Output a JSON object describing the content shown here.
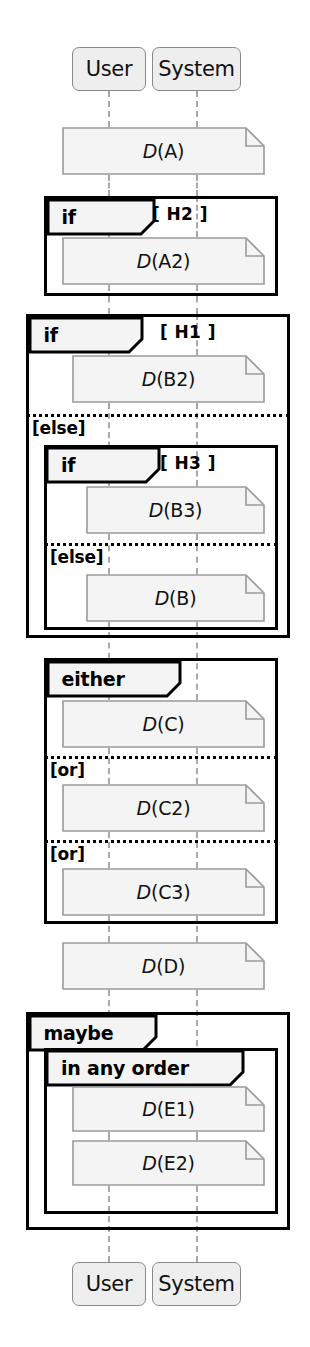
{
  "diagram": {
    "kind": "uml-sequence-diagram",
    "width": 310,
    "height": 1347,
    "colors": {
      "frame_border": "#000000",
      "note_fill": "#f4f4f4",
      "note_border": "#9a9a9a",
      "actor_fill": "#eeeeee",
      "actor_border": "#8a8a8a",
      "lifeline": "#a9a9a9",
      "text": "#111111"
    }
  },
  "actors": {
    "header": [
      {
        "name": "User",
        "x": 72,
        "y": 47,
        "w": 74,
        "h": 44
      },
      {
        "name": "System",
        "x": 152,
        "y": 47,
        "w": 89,
        "h": 44
      }
    ],
    "footer": [
      {
        "name": "User",
        "x": 72,
        "y": 1262,
        "w": 74,
        "h": 44
      },
      {
        "name": "System",
        "x": 152,
        "y": 1262,
        "w": 89,
        "h": 44
      }
    ]
  },
  "lifelines": [
    {
      "actor": "User",
      "x": 108
    },
    {
      "actor": "System",
      "x": 196
    }
  ],
  "notes": [
    {
      "id": "A",
      "prefix": "D",
      "arg": "(A)",
      "x": 62,
      "y": 127,
      "w": 203,
      "h": 48
    },
    {
      "id": "A2",
      "prefix": "D",
      "arg": "(A2)",
      "x": 62,
      "y": 237,
      "w": 203,
      "h": 48
    },
    {
      "id": "B2",
      "prefix": "D",
      "arg": "(B2)",
      "x": 72,
      "y": 355,
      "w": 193,
      "h": 48
    },
    {
      "id": "B3",
      "prefix": "D",
      "arg": "(B3)",
      "x": 86,
      "y": 486,
      "w": 179,
      "h": 48
    },
    {
      "id": "B",
      "prefix": "D",
      "arg": "(B)",
      "x": 86,
      "y": 574,
      "w": 179,
      "h": 48
    },
    {
      "id": "C",
      "prefix": "D",
      "arg": "(C)",
      "x": 62,
      "y": 700,
      "w": 203,
      "h": 48
    },
    {
      "id": "C2",
      "prefix": "D",
      "arg": "(C2)",
      "x": 62,
      "y": 784,
      "w": 203,
      "h": 48
    },
    {
      "id": "C3",
      "prefix": "D",
      "arg": "(C3)",
      "x": 62,
      "y": 868,
      "w": 203,
      "h": 48
    },
    {
      "id": "D",
      "prefix": "D",
      "arg": "(D)",
      "x": 62,
      "y": 942,
      "w": 203,
      "h": 48
    },
    {
      "id": "E1",
      "prefix": "D",
      "arg": "(E1)",
      "x": 72,
      "y": 1086,
      "w": 193,
      "h": 46
    },
    {
      "id": "E2",
      "prefix": "D",
      "arg": "(E2)",
      "x": 72,
      "y": 1140,
      "w": 193,
      "h": 46
    }
  ],
  "fragments": [
    {
      "id": "h2",
      "operator": "if",
      "guard": "[ H2 ]",
      "guard_x": 152,
      "guard_y": 204,
      "tab_width": 106,
      "x": 44,
      "y": 196,
      "w": 234,
      "h": 100,
      "inner": false,
      "separators": [],
      "operand_labels": []
    },
    {
      "id": "h1",
      "operator": "if",
      "guard": "[ H1 ]",
      "guard_x": 160,
      "guard_y": 322,
      "tab_width": 112,
      "x": 26,
      "y": 314,
      "w": 264,
      "h": 324,
      "inner": false,
      "separators": [
        {
          "y": 414,
          "x": 26,
          "w": 264
        }
      ],
      "operand_labels": [
        {
          "text": "[else]",
          "x": 32,
          "y": 418
        }
      ]
    },
    {
      "id": "h3",
      "operator": "if",
      "guard": "[ H3 ]",
      "guard_x": 160,
      "guard_y": 453,
      "tab_width": 112,
      "x": 44,
      "y": 445,
      "w": 234,
      "h": 185,
      "inner": true,
      "separators": [
        {
          "y": 543,
          "x": 44,
          "w": 234
        }
      ],
      "operand_labels": [
        {
          "text": "[else]",
          "x": 50,
          "y": 547
        }
      ]
    },
    {
      "id": "alt-c",
      "operator": "either",
      "guard": "",
      "guard_x": 0,
      "guard_y": 0,
      "tab_width": 132,
      "x": 44,
      "y": 658,
      "w": 234,
      "h": 266,
      "inner": false,
      "separators": [
        {
          "y": 756,
          "x": 44,
          "w": 234
        },
        {
          "y": 840,
          "x": 44,
          "w": 234
        }
      ],
      "operand_labels": [
        {
          "text": "[or]",
          "x": 50,
          "y": 760
        },
        {
          "text": "[or]",
          "x": 50,
          "y": 844
        }
      ]
    },
    {
      "id": "opt-e",
      "operator": "maybe",
      "guard": "",
      "guard_x": 0,
      "guard_y": 0,
      "tab_width": 126,
      "x": 26,
      "y": 1012,
      "w": 264,
      "h": 218,
      "inner": false,
      "separators": [],
      "operand_labels": []
    },
    {
      "id": "par-e",
      "operator": "in any order",
      "guard": "",
      "guard_x": 0,
      "guard_y": 0,
      "tab_width": 196,
      "x": 44,
      "y": 1048,
      "w": 234,
      "h": 166,
      "inner": true,
      "separators": [],
      "operand_labels": []
    }
  ],
  "lifeline_segments": [
    {
      "x": 108,
      "y": 91,
      "h": 36
    },
    {
      "x": 196,
      "y": 91,
      "h": 36
    },
    {
      "x": 108,
      "y": 175,
      "h": 21
    },
    {
      "x": 196,
      "y": 175,
      "h": 21
    },
    {
      "x": 108,
      "y": 196,
      "h": 41
    },
    {
      "x": 196,
      "y": 196,
      "h": 41
    },
    {
      "x": 108,
      "y": 285,
      "h": 29
    },
    {
      "x": 196,
      "y": 285,
      "h": 29
    },
    {
      "x": 108,
      "y": 296,
      "h": 18
    },
    {
      "x": 196,
      "y": 296,
      "h": 18
    },
    {
      "x": 108,
      "y": 314,
      "h": 41
    },
    {
      "x": 196,
      "y": 314,
      "h": 41
    },
    {
      "x": 108,
      "y": 403,
      "h": 83
    },
    {
      "x": 196,
      "y": 403,
      "h": 83
    },
    {
      "x": 108,
      "y": 534,
      "h": 40
    },
    {
      "x": 196,
      "y": 534,
      "h": 40
    },
    {
      "x": 108,
      "y": 622,
      "h": 78
    },
    {
      "x": 196,
      "y": 622,
      "h": 78
    },
    {
      "x": 108,
      "y": 748,
      "h": 36
    },
    {
      "x": 196,
      "y": 748,
      "h": 36
    },
    {
      "x": 108,
      "y": 832,
      "h": 36
    },
    {
      "x": 196,
      "y": 832,
      "h": 36
    },
    {
      "x": 108,
      "y": 916,
      "h": 26
    },
    {
      "x": 196,
      "y": 916,
      "h": 26
    },
    {
      "x": 108,
      "y": 990,
      "h": 96
    },
    {
      "x": 196,
      "y": 990,
      "h": 96
    },
    {
      "x": 108,
      "y": 1132,
      "h": 8
    },
    {
      "x": 196,
      "y": 1132,
      "h": 8
    },
    {
      "x": 108,
      "y": 1186,
      "h": 76
    },
    {
      "x": 196,
      "y": 1186,
      "h": 76
    }
  ]
}
